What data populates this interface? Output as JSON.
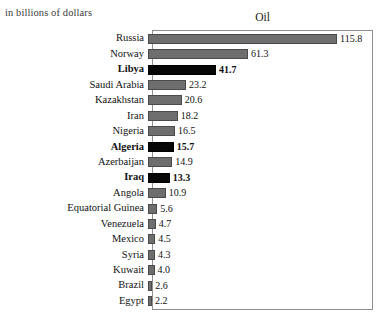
{
  "units_note": "in billions of dollars",
  "chart_data": {
    "type": "bar",
    "orientation": "horizontal",
    "title": "Oil",
    "subtitle": "in billions of dollars",
    "xlabel": "",
    "ylabel": "",
    "xlim": [
      0,
      136
    ],
    "grid": false,
    "legend": null,
    "value_unit": "billions of dollars",
    "colors": {
      "bar_default": "#6e6e6e",
      "bar_default_border": "#4a4a4a",
      "bar_highlight": "#070707",
      "bar_highlight_border": "#000000",
      "frame": "#8f8f8f",
      "text": "#111111",
      "background": "#ffffff"
    },
    "categories": [
      "Russia",
      "Norway",
      "Libya",
      "Saudi Arabia",
      "Kazakhstan",
      "Iran",
      "Nigeria",
      "Algeria",
      "Azerbaijan",
      "Iraq",
      "Angola",
      "Equatorial Guinea",
      "Venezuela",
      "Mexico",
      "Syria",
      "Kuwait",
      "Brazil",
      "Egypt"
    ],
    "values": [
      115.8,
      61.3,
      41.7,
      23.2,
      20.6,
      18.2,
      16.5,
      15.7,
      14.9,
      13.3,
      10.9,
      5.6,
      4.7,
      4.5,
      4.3,
      4.0,
      2.6,
      2.2
    ],
    "value_labels": [
      "115.8",
      "61.3",
      "41.7",
      "23.2",
      "20.6",
      "18.2",
      "16.5",
      "15.7",
      "14.9",
      "13.3",
      "10.9",
      "5.6",
      "4.7",
      "4.5",
      "4.3",
      "4.0",
      "2.6",
      "2.2"
    ],
    "highlighted": [
      false,
      false,
      true,
      false,
      false,
      false,
      false,
      true,
      false,
      true,
      false,
      false,
      false,
      false,
      false,
      false,
      false,
      false
    ]
  }
}
